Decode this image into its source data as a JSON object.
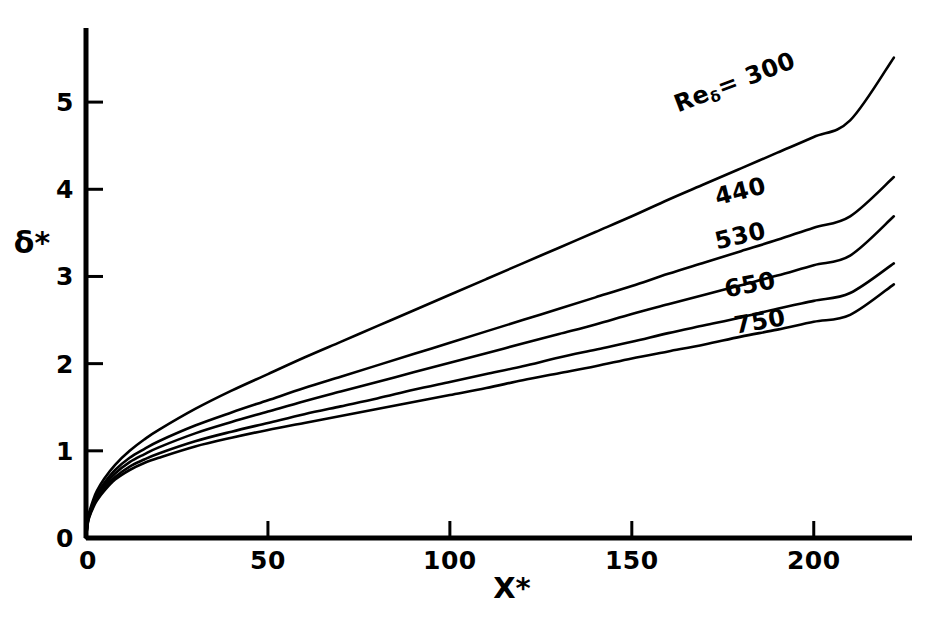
{
  "chart_data": {
    "type": "line",
    "title": "",
    "xlabel": "X*",
    "ylabel": "δ*",
    "xlim": [
      0,
      227
    ],
    "ylim": [
      0,
      5.85
    ],
    "grid": false,
    "legend_position": "inline-right-of-curves",
    "x_ticks": [
      0,
      50,
      100,
      150,
      200
    ],
    "x_tick_labels": [
      "0",
      "50",
      "100",
      "150",
      "200"
    ],
    "y_ticks": [
      0,
      1,
      2,
      3,
      4,
      5
    ],
    "y_tick_labels": [
      "0",
      "1",
      "2",
      "3",
      "4",
      "5"
    ],
    "series": [
      {
        "name": "Reδ = 300",
        "label": "300",
        "label_prefix": "Re",
        "label_subscript": "δ",
        "label_full": "Reδ= 300",
        "color": "#000000",
        "points": [
          [
            0,
            0
          ],
          [
            0.5,
            0.22
          ],
          [
            1,
            0.31
          ],
          [
            2,
            0.44
          ],
          [
            3,
            0.54
          ],
          [
            5,
            0.68
          ],
          [
            8,
            0.84
          ],
          [
            12,
            1.0
          ],
          [
            16,
            1.13
          ],
          [
            20,
            1.24
          ],
          [
            30,
            1.48
          ],
          [
            40,
            1.69
          ],
          [
            50,
            1.88
          ],
          [
            60,
            2.07
          ],
          [
            70,
            2.25
          ],
          [
            80,
            2.43
          ],
          [
            90,
            2.61
          ],
          [
            100,
            2.79
          ],
          [
            110,
            2.97
          ],
          [
            120,
            3.15
          ],
          [
            130,
            3.33
          ],
          [
            140,
            3.51
          ],
          [
            150,
            3.69
          ],
          [
            160,
            3.88
          ],
          [
            170,
            4.06
          ],
          [
            180,
            4.24
          ],
          [
            190,
            4.42
          ],
          [
            200,
            4.6
          ],
          [
            210,
            4.79
          ],
          [
            222,
            5.51
          ]
        ]
      },
      {
        "name": "Reδ = 440",
        "label": "440",
        "color": "#000000",
        "points": [
          [
            0,
            0
          ],
          [
            0.5,
            0.2
          ],
          [
            1,
            0.29
          ],
          [
            2,
            0.41
          ],
          [
            3,
            0.5
          ],
          [
            5,
            0.63
          ],
          [
            8,
            0.78
          ],
          [
            12,
            0.92
          ],
          [
            16,
            1.02
          ],
          [
            20,
            1.11
          ],
          [
            30,
            1.29
          ],
          [
            40,
            1.44
          ],
          [
            50,
            1.58
          ],
          [
            60,
            1.72
          ],
          [
            70,
            1.85
          ],
          [
            80,
            1.98
          ],
          [
            90,
            2.11
          ],
          [
            100,
            2.24
          ],
          [
            110,
            2.37
          ],
          [
            120,
            2.5
          ],
          [
            130,
            2.63
          ],
          [
            140,
            2.76
          ],
          [
            150,
            2.89
          ],
          [
            160,
            3.03
          ],
          [
            170,
            3.16
          ],
          [
            180,
            3.29
          ],
          [
            190,
            3.42
          ],
          [
            200,
            3.56
          ],
          [
            210,
            3.69
          ],
          [
            222,
            4.14
          ]
        ]
      },
      {
        "name": "Reδ = 530",
        "label": "530",
        "color": "#000000",
        "points": [
          [
            0,
            0
          ],
          [
            0.5,
            0.19
          ],
          [
            1,
            0.28
          ],
          [
            2,
            0.39
          ],
          [
            3,
            0.48
          ],
          [
            5,
            0.6
          ],
          [
            8,
            0.74
          ],
          [
            12,
            0.87
          ],
          [
            16,
            0.96
          ],
          [
            20,
            1.04
          ],
          [
            30,
            1.2
          ],
          [
            40,
            1.33
          ],
          [
            50,
            1.45
          ],
          [
            60,
            1.57
          ],
          [
            70,
            1.68
          ],
          [
            80,
            1.79
          ],
          [
            90,
            1.9
          ],
          [
            100,
            2.01
          ],
          [
            110,
            2.12
          ],
          [
            120,
            2.23
          ],
          [
            130,
            2.34
          ],
          [
            140,
            2.45
          ],
          [
            150,
            2.57
          ],
          [
            160,
            2.68
          ],
          [
            170,
            2.79
          ],
          [
            180,
            2.9
          ],
          [
            190,
            3.01
          ],
          [
            200,
            3.13
          ],
          [
            210,
            3.24
          ],
          [
            222,
            3.69
          ]
        ]
      },
      {
        "name": "Reδ = 650",
        "label": "650",
        "color": "#000000",
        "points": [
          [
            0,
            0
          ],
          [
            0.5,
            0.18
          ],
          [
            1,
            0.26
          ],
          [
            2,
            0.37
          ],
          [
            3,
            0.45
          ],
          [
            5,
            0.57
          ],
          [
            8,
            0.7
          ],
          [
            12,
            0.82
          ],
          [
            16,
            0.9
          ],
          [
            20,
            0.97
          ],
          [
            30,
            1.11
          ],
          [
            40,
            1.22
          ],
          [
            50,
            1.32
          ],
          [
            60,
            1.42
          ],
          [
            70,
            1.51
          ],
          [
            80,
            1.6
          ],
          [
            90,
            1.7
          ],
          [
            100,
            1.79
          ],
          [
            110,
            1.88
          ],
          [
            120,
            1.97
          ],
          [
            130,
            2.07
          ],
          [
            140,
            2.16
          ],
          [
            150,
            2.25
          ],
          [
            160,
            2.35
          ],
          [
            170,
            2.44
          ],
          [
            180,
            2.53
          ],
          [
            190,
            2.63
          ],
          [
            200,
            2.72
          ],
          [
            210,
            2.81
          ],
          [
            222,
            3.15
          ]
        ]
      },
      {
        "name": "Reδ = 750",
        "label": "750",
        "color": "#000000",
        "points": [
          [
            0,
            0
          ],
          [
            0.5,
            0.17
          ],
          [
            1,
            0.25
          ],
          [
            2,
            0.35
          ],
          [
            3,
            0.43
          ],
          [
            5,
            0.54
          ],
          [
            8,
            0.67
          ],
          [
            12,
            0.78
          ],
          [
            16,
            0.86
          ],
          [
            20,
            0.92
          ],
          [
            30,
            1.05
          ],
          [
            40,
            1.15
          ],
          [
            50,
            1.24
          ],
          [
            60,
            1.32
          ],
          [
            70,
            1.4
          ],
          [
            80,
            1.48
          ],
          [
            90,
            1.56
          ],
          [
            100,
            1.64
          ],
          [
            110,
            1.72
          ],
          [
            120,
            1.81
          ],
          [
            130,
            1.89
          ],
          [
            140,
            1.97
          ],
          [
            150,
            2.06
          ],
          [
            160,
            2.14
          ],
          [
            170,
            2.22
          ],
          [
            180,
            2.31
          ],
          [
            190,
            2.39
          ],
          [
            200,
            2.48
          ],
          [
            210,
            2.56
          ],
          [
            222,
            2.91
          ]
        ]
      }
    ],
    "annotations": [
      {
        "text": "Reδ= 300",
        "x": 172,
        "y": 4.82,
        "rotation": -21
      },
      {
        "text": "440",
        "x": 180,
        "y": 3.87,
        "rotation": -14
      },
      {
        "text": "530",
        "x": 180,
        "y": 3.37,
        "rotation": -13
      },
      {
        "text": "650",
        "x": 183,
        "y": 2.83,
        "rotation": -11
      },
      {
        "text": "750",
        "x": 186,
        "y": 2.43,
        "rotation": -10
      }
    ]
  },
  "axes": {
    "y_label": "δ*",
    "x_label": "X*",
    "x_tick_labels": [
      "0",
      "50",
      "100",
      "150",
      "200"
    ],
    "y_tick_labels": [
      "0",
      "1",
      "2",
      "3",
      "4",
      "5"
    ]
  },
  "curve_labels": {
    "first_prefix": "Re",
    "first_subscript": "δ",
    "first_value": "= 300",
    "second": "440",
    "third": "530",
    "fourth": "650",
    "fifth": "750"
  },
  "style": {
    "line_color": "#000000",
    "axis_color": "#000000",
    "background": "#ffffff"
  }
}
